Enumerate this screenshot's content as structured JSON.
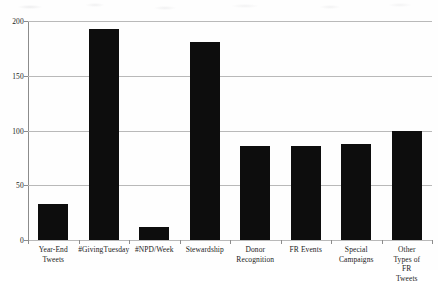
{
  "chart_data": {
    "type": "bar",
    "title": "",
    "subtitle": "",
    "xlabel": "",
    "ylabel": "",
    "categories": [
      "Year-End\nTweets",
      "#GivingTuesday",
      "#NPD/Week",
      "Stewardship",
      "Donor\nRecognition",
      "FR Events",
      "Special\nCampaigns",
      "Other Types of\nFR Tweets"
    ],
    "values": [
      33,
      193,
      12,
      181,
      86,
      86,
      88,
      100
    ],
    "ylim": [
      0,
      200
    ],
    "yticks": [
      0,
      50,
      100,
      150,
      200
    ],
    "ytick_labels": [
      "0",
      "50",
      "100",
      "150",
      "200"
    ],
    "grid": true,
    "grid_axis": "y",
    "legend": false,
    "legend_position": "none",
    "bar_color": "#0d0d0d",
    "gridline_color": "#b9b9b9",
    "axis_color": "#8c8c8c",
    "background_color": "#ffffff"
  }
}
